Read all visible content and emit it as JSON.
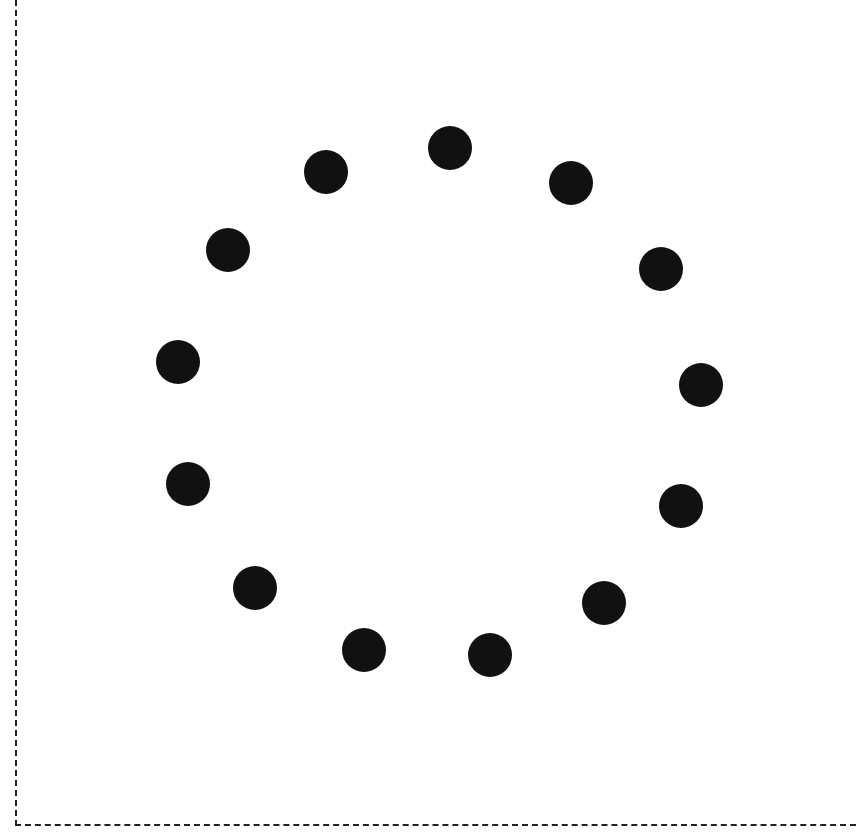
{
  "canvas": {
    "width": 856,
    "height": 835,
    "background": "#ffffff"
  },
  "frame": {
    "style": "dashed",
    "color": "#222222",
    "sides": [
      "left",
      "bottom"
    ]
  },
  "dots": {
    "color": "#111111",
    "radius": 22,
    "count": 13,
    "items": [
      {
        "x": 450,
        "y": 148
      },
      {
        "x": 571,
        "y": 183
      },
      {
        "x": 661,
        "y": 269
      },
      {
        "x": 701,
        "y": 385
      },
      {
        "x": 681,
        "y": 506
      },
      {
        "x": 604,
        "y": 603
      },
      {
        "x": 490,
        "y": 655
      },
      {
        "x": 364,
        "y": 650
      },
      {
        "x": 255,
        "y": 588
      },
      {
        "x": 188,
        "y": 484
      },
      {
        "x": 178,
        "y": 362
      },
      {
        "x": 228,
        "y": 250
      },
      {
        "x": 326,
        "y": 172
      }
    ]
  }
}
